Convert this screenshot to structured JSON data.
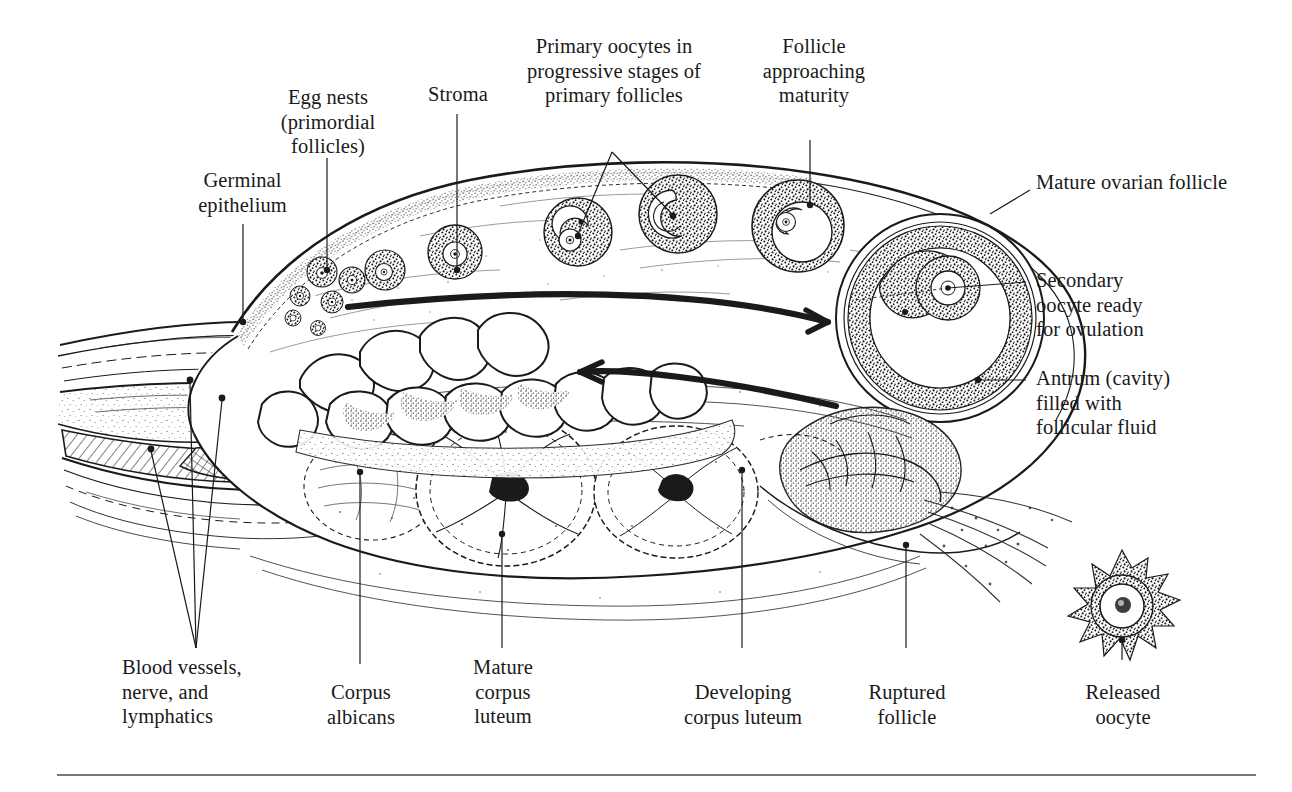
{
  "figure": {
    "ink_color": "#1a1a1a",
    "background": "#ffffff"
  },
  "labels": {
    "germinal_epithelium": "Germinal\nepithelium",
    "egg_nests": "Egg nests\n(primordial\nfollicles)",
    "stroma": "Stroma",
    "primary_oocytes": "Primary oocytes in\nprogressive stages of\nprimary follicles",
    "follicle_maturity": "Follicle\napproaching\nmaturity",
    "mature_ovarian_follicle": "Mature ovarian follicle",
    "secondary_oocyte": "Secondary\noocyte ready\nfor ovulation",
    "antrum": "Antrum (cavity)\nfilled with\nfollicular fluid",
    "blood_vessels": "Blood vessels,\nnerve, and\nlymphatics",
    "corpus_albicans": "Corpus\nalbicans",
    "mature_corpus_luteum": "Mature\ncorpus\nluteum",
    "developing_corpus_luteum": "Developing\ncorpus luteum",
    "ruptured_follicle": "Ruptured\nfollicle",
    "released_oocyte": "Released\noocyte"
  },
  "structures": [
    {
      "name": "germinal-epithelium",
      "note": "outer surface layer of ovary"
    },
    {
      "name": "egg-nests-primordial-follicles",
      "note": "cluster of small follicles at upper left cortex"
    },
    {
      "name": "stroma",
      "note": "connective tissue of ovarian cortex"
    },
    {
      "name": "primary-follicles",
      "count": 6,
      "note": "progressively larger follicles along upper cortex"
    },
    {
      "name": "follicle-approaching-maturity",
      "note": "large follicle right of center top"
    },
    {
      "name": "mature-ovarian-follicle",
      "note": "largest follicle at right pole"
    },
    {
      "name": "secondary-oocyte",
      "note": "oocyte within mature follicle"
    },
    {
      "name": "antrum",
      "note": "fluid-filled cavity of mature follicle"
    },
    {
      "name": "ruptured-follicle",
      "note": "collapsed follicle at lower right after ovulation"
    },
    {
      "name": "released-oocyte",
      "note": "oocyte with corona radiata outside ovary"
    },
    {
      "name": "developing-corpus-luteum",
      "note": "lower right of the three luteal bodies"
    },
    {
      "name": "mature-corpus-luteum",
      "note": "central luteal body"
    },
    {
      "name": "corpus-albicans",
      "note": "leftmost regressing luteal body"
    },
    {
      "name": "hilum-vessels",
      "note": "blood vessels, nerves and lymphatics entering at hilum"
    }
  ],
  "annotations": {
    "cycle_arrow_top": "clockwise progression arrow pointing right",
    "cycle_arrow_bottom": "return arrow pointing left"
  }
}
